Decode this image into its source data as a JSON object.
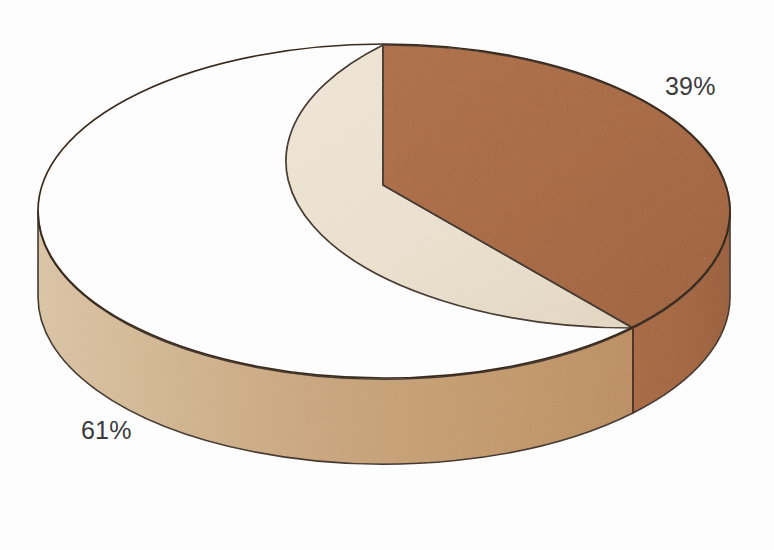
{
  "chart_data": {
    "type": "pie",
    "title": "",
    "subtitle": "",
    "xlabel": "",
    "ylabel": "",
    "three_d": true,
    "grid": false,
    "legend_position": "none",
    "labels_shown": true,
    "label_format": "percent",
    "start_angle_deg": 0,
    "direction": "clockwise",
    "categories": [
      "Segment 1",
      "Segment 2"
    ],
    "values": [
      39,
      61
    ],
    "slices": [
      {
        "label": "39%",
        "value": 39,
        "unit": "%",
        "color": "#a8663a",
        "side_color": "#9d5e33",
        "label_x": 665,
        "label_y": 74
      },
      {
        "label": "61%",
        "value": 61,
        "unit": "%",
        "color": "#ece2d0",
        "side_color": "#cba77e",
        "label_x": 81,
        "label_y": 418
      }
    ]
  },
  "labels": {
    "slice_a": "39%",
    "slice_b": "61%"
  },
  "colors": {
    "background": "#fdfdfd",
    "slice_dark_top": "#a8663a",
    "slice_dark_side": "#9d5e33",
    "slice_light_top": "#ece2d0",
    "slice_light_side_left": "#d6bc9a",
    "slice_light_side_right": "#c2945f",
    "outline": "#3a2a1c",
    "label_text": "#3b3b3b"
  },
  "geometry": {
    "center_x": 384,
    "center_y": 211,
    "radius_x": 346,
    "radius_y": 167,
    "depth": 85,
    "apex_x": 383,
    "apex_y": 185
  }
}
